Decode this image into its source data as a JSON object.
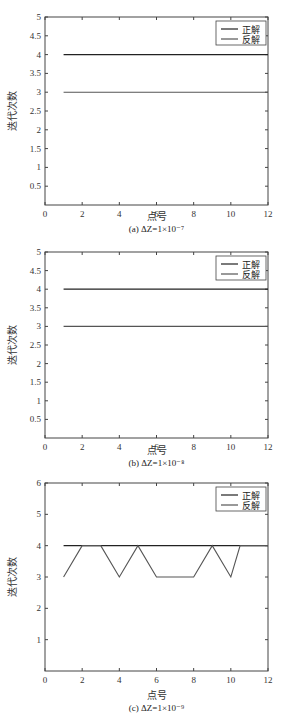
{
  "chart_data": [
    {
      "type": "line",
      "panel": "a",
      "caption": "(a) ΔZ=1×10⁻⁷",
      "xlabel": "点号",
      "ylabel": "迭代次数",
      "xlim": [
        0,
        12
      ],
      "ylim": [
        0,
        5
      ],
      "xticks": [
        "0",
        "2",
        "4",
        "6",
        "8",
        "10",
        "12"
      ],
      "yticks": [
        "0.5",
        "1",
        "1.5",
        "2",
        "2.5",
        "3",
        "3.5",
        "4",
        "4.5",
        "5"
      ],
      "grid": false,
      "legend_position": "upper right",
      "legend": [
        "正解",
        "反解"
      ],
      "x": [
        1,
        2,
        3,
        4,
        5,
        6,
        7,
        8,
        9,
        10,
        11,
        12
      ],
      "series": [
        {
          "name": "正解",
          "color": "#222222",
          "values": [
            4,
            4,
            4,
            4,
            4,
            4,
            4,
            4,
            4,
            4,
            4,
            4
          ]
        },
        {
          "name": "反解",
          "color": "#555555",
          "values": [
            3,
            3,
            3,
            3,
            3,
            3,
            3,
            3,
            3,
            3,
            3,
            3
          ]
        }
      ]
    },
    {
      "type": "line",
      "panel": "b",
      "caption": "(b) ΔZ=1×10⁻⁸",
      "xlabel": "点号",
      "ylabel": "迭代次数",
      "xlim": [
        0,
        12
      ],
      "ylim": [
        0,
        5
      ],
      "xticks": [
        "0",
        "2",
        "4",
        "6",
        "8",
        "10",
        "12"
      ],
      "yticks": [
        "0.5",
        "1",
        "1.5",
        "2",
        "2.5",
        "3",
        "3.5",
        "4",
        "4.5",
        "5"
      ],
      "grid": false,
      "legend_position": "upper right",
      "legend": [
        "正解",
        "反解"
      ],
      "x": [
        1,
        2,
        3,
        4,
        5,
        6,
        7,
        8,
        9,
        10,
        11,
        12
      ],
      "series": [
        {
          "name": "正解",
          "color": "#222222",
          "values": [
            4,
            4,
            4,
            4,
            4,
            4,
            4,
            4,
            4,
            4,
            4,
            4
          ]
        },
        {
          "name": "反解",
          "color": "#555555",
          "values": [
            3,
            3,
            3,
            3,
            3,
            3,
            3,
            3,
            3,
            3,
            3,
            3
          ]
        }
      ]
    },
    {
      "type": "line",
      "panel": "c",
      "caption": "(c) ΔZ=1×10⁻⁹",
      "xlabel": "点号",
      "ylabel": "迭代次数",
      "xlim": [
        0,
        12
      ],
      "ylim": [
        0,
        6
      ],
      "xticks": [
        "0",
        "2",
        "4",
        "6",
        "8",
        "10",
        "12"
      ],
      "yticks": [
        "1",
        "2",
        "3",
        "4",
        "5",
        "6"
      ],
      "grid": false,
      "legend_position": "upper right",
      "legend": [
        "正解",
        "反解"
      ],
      "series": [
        {
          "name": "正解",
          "color": "#222222",
          "x": [
            1,
            2,
            3,
            4,
            5,
            6,
            7,
            8,
            9,
            10,
            11,
            12
          ],
          "values": [
            4,
            4,
            4,
            4,
            4,
            4,
            4,
            4,
            4,
            4,
            4,
            4
          ]
        },
        {
          "name": "反解",
          "color": "#555555",
          "x": [
            1,
            2,
            3,
            4,
            5,
            6,
            7,
            8,
            9,
            10,
            10.5,
            11,
            12
          ],
          "values": [
            3,
            4,
            4,
            3,
            4,
            3,
            3,
            3,
            4,
            3,
            4,
            4,
            4
          ]
        }
      ]
    }
  ]
}
